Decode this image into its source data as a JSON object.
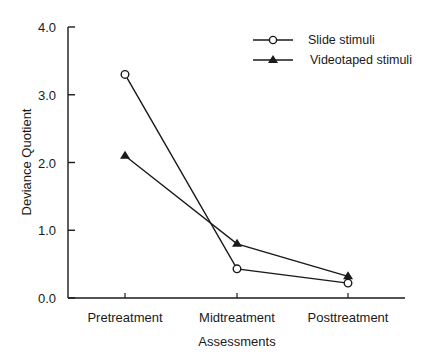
{
  "chart_data": {
    "type": "line",
    "title": "",
    "xlabel": "Assessments",
    "ylabel": "Deviance Quotient",
    "categories": [
      "Pretreatment",
      "Midtreatment",
      "Posttreatment"
    ],
    "series": [
      {
        "name": "Slide stimuli",
        "marker": "open-circle",
        "values": [
          3.3,
          0.43,
          0.22
        ]
      },
      {
        "name": "Videotaped stimuli",
        "marker": "filled-triangle",
        "values": [
          2.1,
          0.8,
          0.32
        ]
      }
    ],
    "ylim": [
      0,
      4.0
    ],
    "yticks": [
      "0.0",
      "1.0",
      "2.0",
      "3.0",
      "4.0"
    ],
    "grid": false,
    "legend_position": "top-right"
  },
  "legend": {
    "items": [
      {
        "label": "Slide stimuli"
      },
      {
        "label": "Videotaped stimuli"
      }
    ]
  }
}
